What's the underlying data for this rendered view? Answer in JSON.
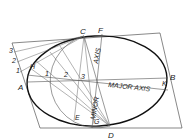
{
  "diagram": {
    "points": {
      "A": "A",
      "B": "B",
      "C": "C",
      "D": "D",
      "E": "E",
      "F": "F",
      "G": "G",
      "H": "H",
      "K": "K"
    },
    "divisions_left": [
      "1",
      "2",
      "3"
    ],
    "divisions_axis": [
      "1",
      "2",
      "3"
    ],
    "axis_labels": {
      "major": "MAJOR AXIS",
      "minor": "MINOR",
      "axis": "AXIS"
    },
    "colors": {
      "line": "#444444",
      "curve": "#111111",
      "background": "#ffffff"
    }
  }
}
